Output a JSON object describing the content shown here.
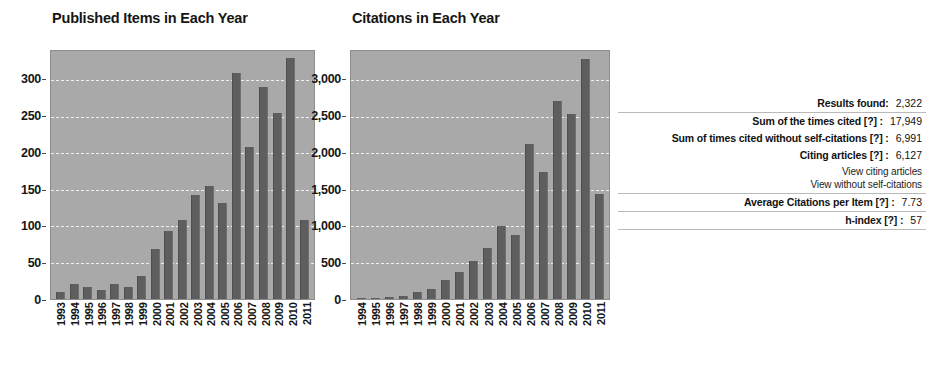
{
  "chart_data": [
    {
      "type": "bar",
      "title": "Published Items in Each Year",
      "xlabel": "",
      "ylabel": "",
      "ylim": [
        0,
        340
      ],
      "yticks": [
        0,
        50,
        100,
        150,
        200,
        250,
        300
      ],
      "ytick_labels": [
        "0",
        "50",
        "100",
        "150",
        "200",
        "250",
        "300"
      ],
      "grid": true,
      "legend": "none",
      "bar_color": "#5e5e5e",
      "plot_background": "#a9a9a9",
      "categories": [
        "1993",
        "1994",
        "1995",
        "1996",
        "1997",
        "1998",
        "1999",
        "2000",
        "2001",
        "2002",
        "2003",
        "2004",
        "2005",
        "2006",
        "2007",
        "2008",
        "2009",
        "2010",
        "2011"
      ],
      "values": [
        10,
        20,
        17,
        13,
        20,
        16,
        31,
        69,
        93,
        108,
        142,
        155,
        132,
        310,
        208,
        290,
        255,
        331,
        109
      ]
    },
    {
      "type": "bar",
      "title": "Citations in Each Year",
      "xlabel": "",
      "ylabel": "",
      "ylim": [
        0,
        3400
      ],
      "yticks": [
        0,
        500,
        1000,
        1500,
        2000,
        2500,
        3000
      ],
      "ytick_labels": [
        "0",
        "500",
        "1,000",
        "1,500",
        "2,000",
        "2,500",
        "3,000"
      ],
      "grid": true,
      "legend": "none",
      "bar_color": "#5e5e5e",
      "plot_background": "#a9a9a9",
      "categories": [
        "1994",
        "1995",
        "1996",
        "1997",
        "1998",
        "1999",
        "2000",
        "2001",
        "2002",
        "2003",
        "2004",
        "2005",
        "2006",
        "2007",
        "2008",
        "2009",
        "2010",
        "2011"
      ],
      "values": [
        8,
        20,
        28,
        45,
        95,
        140,
        255,
        370,
        520,
        705,
        1000,
        880,
        2120,
        1735,
        2715,
        2540,
        3290,
        1440
      ]
    }
  ],
  "stats_panel": {
    "rows": [
      {
        "label": "Results found:",
        "value": "2,322"
      },
      {
        "label": "Sum of the times cited [?] :",
        "value": "17,949"
      },
      {
        "label": "Sum of times cited without self-citations [?] :",
        "value": "6,991"
      },
      {
        "label": "Citing articles [?] :",
        "value": "6,127"
      },
      {
        "label": "Average Citations per Item [?] :",
        "value": "7.73"
      },
      {
        "label": "h-index [?] :",
        "value": "57"
      }
    ],
    "links": [
      {
        "label": "View citing articles"
      },
      {
        "label": "View without self-citations"
      }
    ]
  }
}
